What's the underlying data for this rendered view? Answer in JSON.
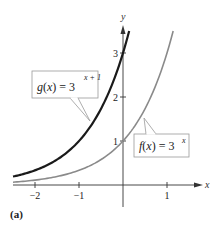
{
  "chart_data": {
    "type": "line",
    "title": "",
    "panel_label": "(a)",
    "xlabel": "x",
    "ylabel": "y",
    "xlim": [
      -2.5,
      1.7
    ],
    "ylim": [
      -0.45,
      3.6
    ],
    "x_ticks": [
      {
        "value": -2,
        "label": "−2"
      },
      {
        "value": -1,
        "label": "−1"
      },
      {
        "value": 1,
        "label": "1"
      }
    ],
    "y_ticks": [
      {
        "value": 1,
        "label": "1"
      },
      {
        "value": 2,
        "label": "2"
      },
      {
        "value": 3,
        "label": "3"
      }
    ],
    "grid": false,
    "legend": "callout-labels",
    "series": [
      {
        "name": "g(x) = 3^(x+1)",
        "label_main": "g(x) = 3",
        "label_exp": "x + 1",
        "formula": "3^(x+1)",
        "color": "#1a1a1a",
        "stroke_width": 2.2,
        "x_range": [
          -2.5,
          0.14
        ],
        "points": [
          [
            -2.5,
            0.19
          ],
          [
            -2,
            0.33
          ],
          [
            -1.5,
            0.58
          ],
          [
            -1,
            1
          ],
          [
            -0.5,
            1.73
          ],
          [
            0,
            3
          ],
          [
            0.14,
            3.5
          ]
        ]
      },
      {
        "name": "f(x) = 3^x",
        "label_main": "f(x) = 3",
        "label_exp": "x",
        "formula": "3^x",
        "color": "#8a8a8a",
        "stroke_width": 1.6,
        "x_range": [
          -2.5,
          1.14
        ],
        "points": [
          [
            -2.5,
            0.06
          ],
          [
            -2,
            0.11
          ],
          [
            -1,
            0.33
          ],
          [
            0,
            1
          ],
          [
            0.5,
            1.73
          ],
          [
            1,
            3
          ],
          [
            1.14,
            3.5
          ]
        ]
      }
    ]
  }
}
